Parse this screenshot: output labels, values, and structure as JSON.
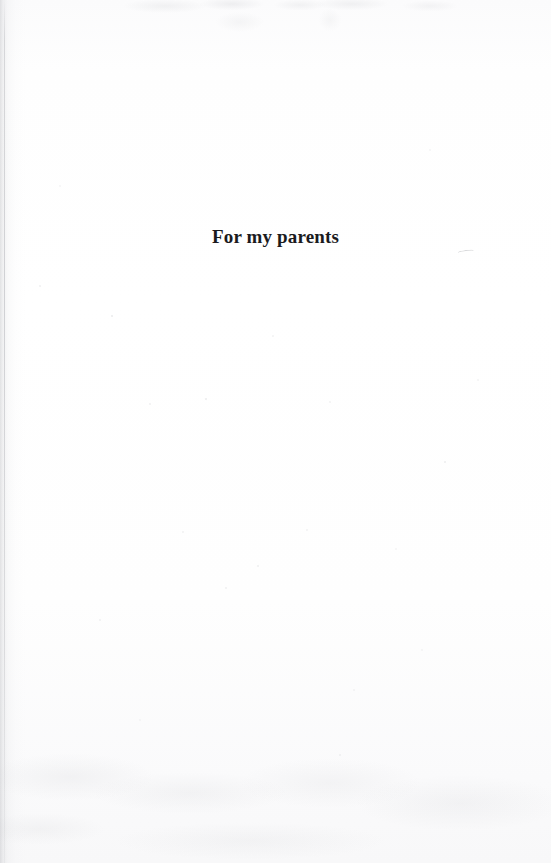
{
  "page": {
    "kind": "book-dedication-page",
    "background_color": "#fefefe",
    "text_color": "#1b1b1d"
  },
  "dedication": {
    "text": "For my parents"
  }
}
